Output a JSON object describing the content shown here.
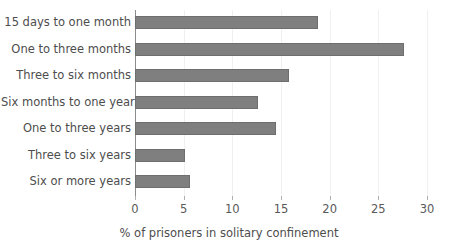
{
  "chart_data": {
    "type": "bar",
    "orientation": "horizontal",
    "title": "",
    "xlabel": "% of prisoners in solitary confinement",
    "ylabel": "",
    "categories": [
      "15 days to one month",
      "One to three months",
      "Three to six months",
      "Six months to one year",
      "One to three years",
      "Three to six years",
      "Six or more years"
    ],
    "values": [
      18.8,
      27.6,
      15.8,
      12.6,
      14.5,
      5.1,
      5.7
    ],
    "xlim": [
      0,
      30
    ],
    "xticks": [
      0,
      5,
      10,
      15,
      20,
      25,
      30
    ],
    "xtick_labels": [
      "0",
      "5",
      "10",
      "15",
      "20",
      "25",
      "30"
    ],
    "grid": "vertical-light",
    "legend": "none",
    "bar_color": "#7f7f7f",
    "bar_edge_color": "#6e6e6e",
    "axis_color": "#8c8c8c",
    "gridline_color": "#f0f0f0",
    "text_color": "#4d4d4d"
  }
}
